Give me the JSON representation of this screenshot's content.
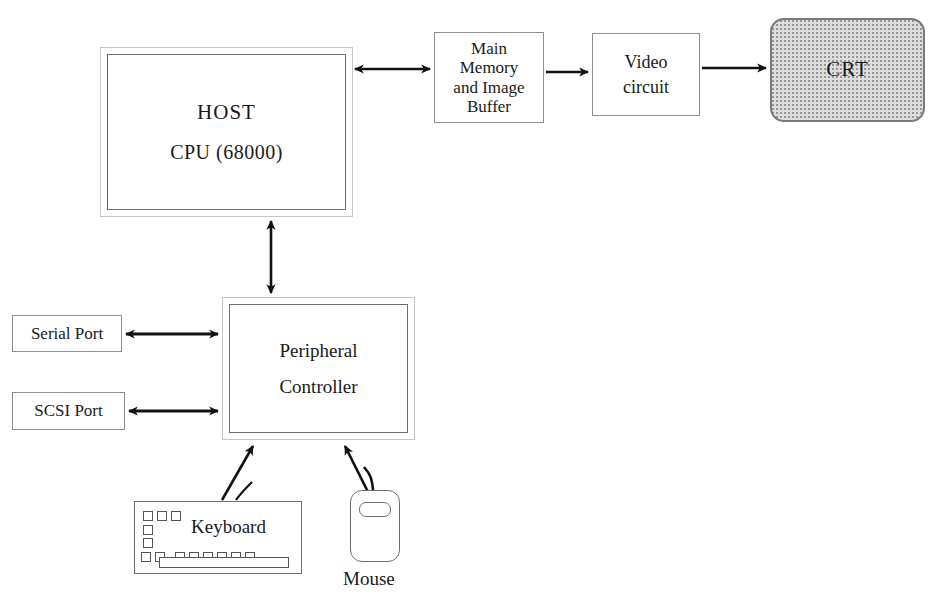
{
  "diagram": {
    "nodes": {
      "host": {
        "line1": "HOST",
        "line2": "CPU (68000)"
      },
      "main_memory": {
        "line1": "Main",
        "line2": "Memory",
        "line3": "and Image",
        "line4": "Buffer"
      },
      "video_circuit": {
        "line1": "Video",
        "line2": "circuit"
      },
      "crt": {
        "label": "CRT"
      },
      "peripheral_controller": {
        "line1": "Peripheral",
        "line2": "Controller"
      },
      "serial_port": {
        "label": "Serial Port"
      },
      "scsi_port": {
        "label": "SCSI Port"
      },
      "keyboard": {
        "label": "Keyboard"
      },
      "mouse": {
        "label": "Mouse"
      }
    },
    "connections": [
      {
        "from": "host",
        "to": "main_memory",
        "arrow": "bidirectional",
        "orientation": "horizontal"
      },
      {
        "from": "main_memory",
        "to": "video_circuit",
        "arrow": "unidirectional",
        "orientation": "horizontal"
      },
      {
        "from": "video_circuit",
        "to": "crt",
        "arrow": "unidirectional",
        "orientation": "horizontal"
      },
      {
        "from": "host",
        "to": "peripheral_controller",
        "arrow": "bidirectional",
        "orientation": "vertical"
      },
      {
        "from": "serial_port",
        "to": "peripheral_controller",
        "arrow": "bidirectional",
        "orientation": "horizontal"
      },
      {
        "from": "scsi_port",
        "to": "peripheral_controller",
        "arrow": "bidirectional",
        "orientation": "horizontal"
      },
      {
        "from": "keyboard",
        "to": "peripheral_controller",
        "arrow": "unidirectional",
        "orientation": "diagonal"
      },
      {
        "from": "mouse",
        "to": "peripheral_controller",
        "arrow": "unidirectional",
        "orientation": "diagonal"
      }
    ],
    "colors": {
      "stroke": "#1a1a1a",
      "box_border": "#6f6f6f",
      "box_border_light": "#c6c6c6",
      "crt_fill": "#dedede",
      "background": "#ffffff"
    }
  }
}
